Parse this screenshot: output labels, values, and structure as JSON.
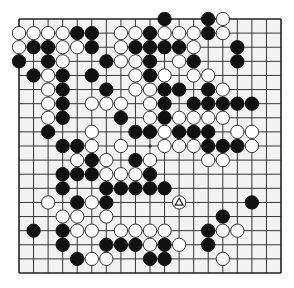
{
  "board": {
    "size": 19,
    "origin": {
      "x": 19,
      "y": 19
    },
    "spacing": {
      "x": 14.556,
      "y": 14.111
    },
    "colors": {
      "background": "#f2f2f2",
      "line": "#222222",
      "black": "#111111",
      "white": "#ffffff",
      "white_stroke": "#333333"
    },
    "last_move": {
      "col": 11,
      "row": 13,
      "color": "white",
      "marker": "triangle"
    },
    "stones": [
      {
        "c": 10,
        "r": 0,
        "s": "B"
      },
      {
        "c": 13,
        "r": 0,
        "s": "B"
      },
      {
        "c": 14,
        "r": 0,
        "s": "W"
      },
      {
        "c": 0,
        "r": 1,
        "s": "W"
      },
      {
        "c": 1,
        "r": 1,
        "s": "W"
      },
      {
        "c": 2,
        "r": 1,
        "s": "W"
      },
      {
        "c": 3,
        "r": 1,
        "s": "W"
      },
      {
        "c": 4,
        "r": 1,
        "s": "B"
      },
      {
        "c": 5,
        "r": 1,
        "s": "B"
      },
      {
        "c": 7,
        "r": 1,
        "s": "W"
      },
      {
        "c": 8,
        "r": 1,
        "s": "W"
      },
      {
        "c": 9,
        "r": 1,
        "s": "B"
      },
      {
        "c": 10,
        "r": 1,
        "s": "W"
      },
      {
        "c": 11,
        "r": 1,
        "s": "W"
      },
      {
        "c": 12,
        "r": 1,
        "s": "W"
      },
      {
        "c": 13,
        "r": 1,
        "s": "B"
      },
      {
        "c": 14,
        "r": 1,
        "s": "W"
      },
      {
        "c": 0,
        "r": 2,
        "s": "W"
      },
      {
        "c": 1,
        "r": 2,
        "s": "B"
      },
      {
        "c": 2,
        "r": 2,
        "s": "B"
      },
      {
        "c": 3,
        "r": 2,
        "s": "W"
      },
      {
        "c": 4,
        "r": 2,
        "s": "W"
      },
      {
        "c": 5,
        "r": 2,
        "s": "B"
      },
      {
        "c": 7,
        "r": 2,
        "s": "W"
      },
      {
        "c": 8,
        "r": 2,
        "s": "B"
      },
      {
        "c": 9,
        "r": 2,
        "s": "B"
      },
      {
        "c": 10,
        "r": 2,
        "s": "B"
      },
      {
        "c": 11,
        "r": 2,
        "s": "B"
      },
      {
        "c": 12,
        "r": 2,
        "s": "W"
      },
      {
        "c": 15,
        "r": 2,
        "s": "B"
      },
      {
        "c": 0,
        "r": 3,
        "s": "B"
      },
      {
        "c": 2,
        "r": 3,
        "s": "B"
      },
      {
        "c": 3,
        "r": 3,
        "s": "W"
      },
      {
        "c": 6,
        "r": 3,
        "s": "B"
      },
      {
        "c": 7,
        "r": 3,
        "s": "W"
      },
      {
        "c": 8,
        "r": 3,
        "s": "W"
      },
      {
        "c": 9,
        "r": 3,
        "s": "B"
      },
      {
        "c": 11,
        "r": 3,
        "s": "W"
      },
      {
        "c": 12,
        "r": 3,
        "s": "B"
      },
      {
        "c": 15,
        "r": 3,
        "s": "B"
      },
      {
        "c": 1,
        "r": 4,
        "s": "B"
      },
      {
        "c": 2,
        "r": 4,
        "s": "W"
      },
      {
        "c": 3,
        "r": 4,
        "s": "B"
      },
      {
        "c": 5,
        "r": 4,
        "s": "B"
      },
      {
        "c": 8,
        "r": 4,
        "s": "W"
      },
      {
        "c": 9,
        "r": 4,
        "s": "B"
      },
      {
        "c": 10,
        "r": 4,
        "s": "W"
      },
      {
        "c": 12,
        "r": 4,
        "s": "W"
      },
      {
        "c": 13,
        "r": 4,
        "s": "W"
      },
      {
        "c": 2,
        "r": 5,
        "s": "W"
      },
      {
        "c": 3,
        "r": 5,
        "s": "B"
      },
      {
        "c": 6,
        "r": 5,
        "s": "B"
      },
      {
        "c": 8,
        "r": 5,
        "s": "W"
      },
      {
        "c": 9,
        "r": 5,
        "s": "W"
      },
      {
        "c": 10,
        "r": 5,
        "s": "B"
      },
      {
        "c": 11,
        "r": 5,
        "s": "B"
      },
      {
        "c": 13,
        "r": 5,
        "s": "B"
      },
      {
        "c": 14,
        "r": 5,
        "s": "W"
      },
      {
        "c": 2,
        "r": 6,
        "s": "W"
      },
      {
        "c": 3,
        "r": 6,
        "s": "B"
      },
      {
        "c": 5,
        "r": 6,
        "s": "W"
      },
      {
        "c": 6,
        "r": 6,
        "s": "W"
      },
      {
        "c": 7,
        "r": 6,
        "s": "W"
      },
      {
        "c": 9,
        "r": 6,
        "s": "W"
      },
      {
        "c": 10,
        "r": 6,
        "s": "B"
      },
      {
        "c": 12,
        "r": 6,
        "s": "B"
      },
      {
        "c": 13,
        "r": 6,
        "s": "B"
      },
      {
        "c": 14,
        "r": 6,
        "s": "B"
      },
      {
        "c": 15,
        "r": 6,
        "s": "B"
      },
      {
        "c": 16,
        "r": 6,
        "s": "B"
      },
      {
        "c": 2,
        "r": 7,
        "s": "W"
      },
      {
        "c": 3,
        "r": 7,
        "s": "B"
      },
      {
        "c": 7,
        "r": 7,
        "s": "B"
      },
      {
        "c": 9,
        "r": 7,
        "s": "W"
      },
      {
        "c": 10,
        "r": 7,
        "s": "B"
      },
      {
        "c": 11,
        "r": 7,
        "s": "W"
      },
      {
        "c": 12,
        "r": 7,
        "s": "W"
      },
      {
        "c": 13,
        "r": 7,
        "s": "W"
      },
      {
        "c": 14,
        "r": 7,
        "s": "W"
      },
      {
        "c": 2,
        "r": 8,
        "s": "B"
      },
      {
        "c": 5,
        "r": 8,
        "s": "W"
      },
      {
        "c": 8,
        "r": 8,
        "s": "B"
      },
      {
        "c": 9,
        "r": 8,
        "s": "B"
      },
      {
        "c": 10,
        "r": 8,
        "s": "W"
      },
      {
        "c": 11,
        "r": 8,
        "s": "B"
      },
      {
        "c": 12,
        "r": 8,
        "s": "B"
      },
      {
        "c": 13,
        "r": 8,
        "s": "B"
      },
      {
        "c": 15,
        "r": 8,
        "s": "W"
      },
      {
        "c": 16,
        "r": 8,
        "s": "W"
      },
      {
        "c": 3,
        "r": 9,
        "s": "B"
      },
      {
        "c": 4,
        "r": 9,
        "s": "B"
      },
      {
        "c": 5,
        "r": 9,
        "s": "W"
      },
      {
        "c": 7,
        "r": 9,
        "s": "W"
      },
      {
        "c": 10,
        "r": 9,
        "s": "W"
      },
      {
        "c": 11,
        "r": 9,
        "s": "W"
      },
      {
        "c": 12,
        "r": 9,
        "s": "W"
      },
      {
        "c": 13,
        "r": 9,
        "s": "B"
      },
      {
        "c": 14,
        "r": 9,
        "s": "B"
      },
      {
        "c": 15,
        "r": 9,
        "s": "B"
      },
      {
        "c": 16,
        "r": 9,
        "s": "W"
      },
      {
        "c": 4,
        "r": 10,
        "s": "W"
      },
      {
        "c": 5,
        "r": 10,
        "s": "B"
      },
      {
        "c": 6,
        "r": 10,
        "s": "W"
      },
      {
        "c": 8,
        "r": 10,
        "s": "B"
      },
      {
        "c": 9,
        "r": 10,
        "s": "W"
      },
      {
        "c": 13,
        "r": 10,
        "s": "W"
      },
      {
        "c": 14,
        "r": 10,
        "s": "W"
      },
      {
        "c": 3,
        "r": 11,
        "s": "B"
      },
      {
        "c": 4,
        "r": 11,
        "s": "B"
      },
      {
        "c": 5,
        "r": 11,
        "s": "B"
      },
      {
        "c": 6,
        "r": 11,
        "s": "W"
      },
      {
        "c": 7,
        "r": 11,
        "s": "W"
      },
      {
        "c": 8,
        "r": 11,
        "s": "W"
      },
      {
        "c": 9,
        "r": 11,
        "s": "B"
      },
      {
        "c": 3,
        "r": 12,
        "s": "B"
      },
      {
        "c": 6,
        "r": 12,
        "s": "B"
      },
      {
        "c": 7,
        "r": 12,
        "s": "B"
      },
      {
        "c": 8,
        "r": 12,
        "s": "B"
      },
      {
        "c": 9,
        "r": 12,
        "s": "B"
      },
      {
        "c": 10,
        "r": 12,
        "s": "B"
      },
      {
        "c": 2,
        "r": 13,
        "s": "W"
      },
      {
        "c": 4,
        "r": 13,
        "s": "B"
      },
      {
        "c": 5,
        "r": 13,
        "s": "W"
      },
      {
        "c": 6,
        "r": 13,
        "s": "B"
      },
      {
        "c": 11,
        "r": 13,
        "s": "W"
      },
      {
        "c": 16,
        "r": 13,
        "s": "B"
      },
      {
        "c": 3,
        "r": 14,
        "s": "W"
      },
      {
        "c": 4,
        "r": 14,
        "s": "W"
      },
      {
        "c": 6,
        "r": 14,
        "s": "W"
      },
      {
        "c": 14,
        "r": 14,
        "s": "B"
      },
      {
        "c": 1,
        "r": 15,
        "s": "B"
      },
      {
        "c": 3,
        "r": 15,
        "s": "B"
      },
      {
        "c": 4,
        "r": 15,
        "s": "W"
      },
      {
        "c": 5,
        "r": 15,
        "s": "W"
      },
      {
        "c": 7,
        "r": 15,
        "s": "W"
      },
      {
        "c": 8,
        "r": 15,
        "s": "W"
      },
      {
        "c": 9,
        "r": 15,
        "s": "W"
      },
      {
        "c": 10,
        "r": 15,
        "s": "W"
      },
      {
        "c": 13,
        "r": 15,
        "s": "B"
      },
      {
        "c": 14,
        "r": 15,
        "s": "W"
      },
      {
        "c": 15,
        "r": 15,
        "s": "W"
      },
      {
        "c": 3,
        "r": 16,
        "s": "B"
      },
      {
        "c": 6,
        "r": 16,
        "s": "B"
      },
      {
        "c": 7,
        "r": 16,
        "s": "B"
      },
      {
        "c": 8,
        "r": 16,
        "s": "B"
      },
      {
        "c": 9,
        "r": 16,
        "s": "W"
      },
      {
        "c": 10,
        "r": 16,
        "s": "B"
      },
      {
        "c": 11,
        "r": 16,
        "s": "W"
      },
      {
        "c": 13,
        "r": 16,
        "s": "B"
      },
      {
        "c": 4,
        "r": 17,
        "s": "B"
      },
      {
        "c": 5,
        "r": 17,
        "s": "W"
      },
      {
        "c": 6,
        "r": 17,
        "s": "W"
      },
      {
        "c": 9,
        "r": 17,
        "s": "B"
      },
      {
        "c": 10,
        "r": 17,
        "s": "B"
      },
      {
        "c": 14,
        "r": 17,
        "s": "W"
      }
    ]
  }
}
